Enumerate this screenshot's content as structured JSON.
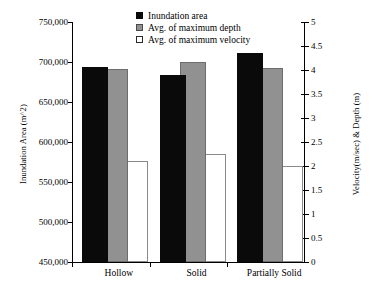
{
  "chart_data": {
    "type": "bar",
    "title": "",
    "categories": [
      "Hollow",
      "Solid",
      "Partially Solid"
    ],
    "series": [
      {
        "name": "Inundation area",
        "axis": "left",
        "color": "#0a0a0a",
        "values": [
          694000,
          684000,
          711000
        ]
      },
      {
        "name": "Avg. of maximum depth",
        "axis": "left",
        "color": "#919191",
        "values": [
          691000,
          700000,
          693000
        ]
      },
      {
        "name": "Avg. of maximum velocity",
        "axis": "right",
        "color": "#ffffff",
        "values": [
          2.1,
          2.25,
          2.0
        ]
      }
    ],
    "xlabel": "",
    "ylabel": "Inundation Area (m^2)",
    "ylabel_right": "Velocity(m/sec) & Depth (m)",
    "ylim": [
      450000,
      750000
    ],
    "ylim_right": [
      0,
      5
    ],
    "yticks": [
      "450,000",
      "500,000",
      "550,000",
      "600,000",
      "650,000",
      "700,000",
      "750,000"
    ],
    "ytick_values": [
      450000,
      500000,
      550000,
      600000,
      650000,
      700000,
      750000
    ],
    "yticks_right": [
      "0",
      "0.5",
      "1",
      "1.5",
      "2",
      "2.5",
      "3",
      "3.5",
      "4",
      "4.5",
      "5"
    ],
    "ytick_values_right": [
      0,
      0.5,
      1,
      1.5,
      2,
      2.5,
      3,
      3.5,
      4,
      4.5,
      5
    ],
    "grid": false,
    "legend_position": "top-center"
  },
  "legend": {
    "items": [
      {
        "label": "Inundation area",
        "swatch": "black-square-icon"
      },
      {
        "label": "Avg. of maximum depth",
        "swatch": "gray-square-icon"
      },
      {
        "label": "Avg. of maximum velocity",
        "swatch": "white-square-icon"
      }
    ]
  }
}
